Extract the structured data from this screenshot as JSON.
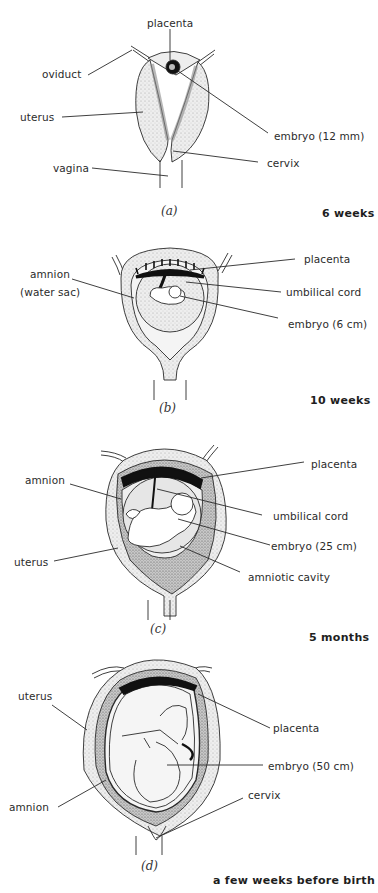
{
  "figure": {
    "panels": [
      {
        "id": "a",
        "caption": "(a)",
        "stage": "6 weeks",
        "labels": {
          "placenta": "placenta",
          "oviduct": "oviduct",
          "uterus": "uterus",
          "embryo": "embryo (12 mm)",
          "vagina": "vagina",
          "cervix": "cervix"
        }
      },
      {
        "id": "b",
        "caption": "(b)",
        "stage": "10 weeks",
        "labels": {
          "placenta": "placenta",
          "amnion_line1": "amnion",
          "amnion_line2": "(water sac)",
          "umbilical_cord": "umbilical cord",
          "embryo": "embryo (6 cm)"
        }
      },
      {
        "id": "c",
        "caption": "(c)",
        "stage": "5 months",
        "labels": {
          "placenta": "placenta",
          "amnion": "amnion",
          "umbilical_cord": "umbilical cord",
          "embryo": "embryo (25 cm)",
          "uterus": "uterus",
          "amniotic_cavity": "amniotic cavity"
        }
      },
      {
        "id": "d",
        "caption": "(d)",
        "stage": "a few weeks before birth",
        "labels": {
          "uterus": "uterus",
          "placenta": "placenta",
          "embryo": "embryo (50 cm)",
          "cervix": "cervix",
          "amnion": "amnion"
        }
      }
    ],
    "colors": {
      "line": "#2a2a2a",
      "tissue_fill": "#ececec",
      "tissue_dark": "#9a9a9a",
      "placenta": "#111111",
      "amniotic_fluid": "#e2e2e2"
    }
  }
}
